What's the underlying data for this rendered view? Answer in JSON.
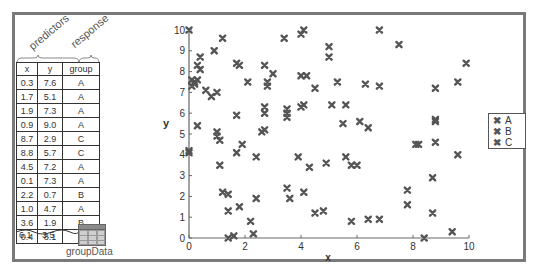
{
  "annotations": {
    "predictors_label": "predictors",
    "response_label": "response"
  },
  "table": {
    "name": "groupData",
    "headers": [
      "x",
      "y",
      "group"
    ],
    "rows": [
      [
        "0.3",
        "7.6",
        "A"
      ],
      [
        "1.7",
        "5.1",
        "A"
      ],
      [
        "1.9",
        "7.3",
        "A"
      ],
      [
        "0.9",
        "9.0",
        "A"
      ],
      [
        "8.7",
        "2.9",
        "C"
      ],
      [
        "8.8",
        "5.7",
        "C"
      ],
      [
        "4.5",
        "7.2",
        "A"
      ],
      [
        "0.1",
        "7.3",
        "A"
      ],
      [
        "2.2",
        "0.7",
        "B"
      ],
      [
        "1.0",
        "4.7",
        "A"
      ],
      [
        "3.6",
        "1.9",
        "B"
      ],
      [
        "0.4",
        "8.1",
        ""
      ]
    ],
    "cutoff_row": [
      "6.1",
      "3.5",
      ""
    ]
  },
  "colors": {
    "marker": "#555555",
    "frame": "#7a7a7a",
    "axis": "#666666"
  },
  "chart_data": {
    "type": "scatter",
    "title": "",
    "xlabel": "x",
    "ylabel": "y",
    "xlim": [
      0,
      10
    ],
    "ylim": [
      0,
      10
    ],
    "xticks": [
      "0",
      "2",
      "4",
      "6",
      "8",
      "10"
    ],
    "yticks": [
      "0",
      "1",
      "2",
      "3",
      "4",
      "5",
      "6",
      "7",
      "8",
      "9",
      "10"
    ],
    "grid": false,
    "legend_position": "right",
    "marker": "x",
    "series": [
      {
        "name": "A",
        "points": [
          [
            0.0,
            10.0
          ],
          [
            1.2,
            9.6
          ],
          [
            0.9,
            9.0
          ],
          [
            0.4,
            8.7
          ],
          [
            0.3,
            8.3
          ],
          [
            0.4,
            8.1
          ],
          [
            1.7,
            8.4
          ],
          [
            1.8,
            8.3
          ],
          [
            2.7,
            8.3
          ],
          [
            3.0,
            7.9
          ],
          [
            0.1,
            7.6
          ],
          [
            0.2,
            7.5
          ],
          [
            0.3,
            7.6
          ],
          [
            0.1,
            7.3
          ],
          [
            0.2,
            7.4
          ],
          [
            0.6,
            7.1
          ],
          [
            1.0,
            7.0
          ],
          [
            0.8,
            6.8
          ],
          [
            2.1,
            7.5
          ],
          [
            2.8,
            7.5
          ],
          [
            2.8,
            7.3
          ],
          [
            4.0,
            7.8
          ],
          [
            4.2,
            7.8
          ],
          [
            4.5,
            7.2
          ],
          [
            1.7,
            5.9
          ],
          [
            2.7,
            6.3
          ],
          [
            2.7,
            6.0
          ],
          [
            3.5,
            6.2
          ],
          [
            3.5,
            6.0
          ],
          [
            3.5,
            5.8
          ],
          [
            0.3,
            5.4
          ],
          [
            1.0,
            5.1
          ],
          [
            1.0,
            4.9
          ],
          [
            1.1,
            4.7
          ],
          [
            2.6,
            5.1
          ],
          [
            2.7,
            5.2
          ],
          [
            0.0,
            4.2
          ],
          [
            0.0,
            4.1
          ],
          [
            1.9,
            4.5
          ],
          [
            1.7,
            4.1
          ],
          [
            2.4,
            3.9
          ],
          [
            1.1,
            3.5
          ]
        ]
      },
      {
        "name": "B",
        "points": [
          [
            1.2,
            2.2
          ],
          [
            1.4,
            2.1
          ],
          [
            1.4,
            1.3
          ],
          [
            1.8,
            1.5
          ],
          [
            2.4,
            1.9
          ],
          [
            2.2,
            0.8
          ],
          [
            2.3,
            0.2
          ],
          [
            1.4,
            0.0
          ],
          [
            1.6,
            0.1
          ],
          [
            3.5,
            2.4
          ],
          [
            3.6,
            1.9
          ],
          [
            4.1,
            2.2
          ],
          [
            4.5,
            1.2
          ],
          [
            3.9,
            3.9
          ],
          [
            4.3,
            3.4
          ],
          [
            4.9,
            3.6
          ],
          [
            5.6,
            3.9
          ],
          [
            5.8,
            3.5
          ],
          [
            6.0,
            3.5
          ],
          [
            5.8,
            0.8
          ],
          [
            6.4,
            0.9
          ],
          [
            6.8,
            0.9
          ],
          [
            7.8,
            2.3
          ],
          [
            7.8,
            1.6
          ]
        ]
      },
      {
        "name": "C",
        "points": [
          [
            3.4,
            9.6
          ],
          [
            4.0,
            9.8
          ],
          [
            4.1,
            10.0
          ],
          [
            5.0,
            9.2
          ],
          [
            5.0,
            8.7
          ],
          [
            6.8,
            10.0
          ],
          [
            7.5,
            9.3
          ],
          [
            5.3,
            7.5
          ],
          [
            6.3,
            7.4
          ],
          [
            6.8,
            7.3
          ],
          [
            8.8,
            7.2
          ],
          [
            9.6,
            7.5
          ],
          [
            9.9,
            8.4
          ],
          [
            5.1,
            6.4
          ],
          [
            5.6,
            6.4
          ],
          [
            6.1,
            5.6
          ],
          [
            4.1,
            6.4
          ],
          [
            4.0,
            6.3
          ],
          [
            5.5,
            5.5
          ],
          [
            6.4,
            5.3
          ],
          [
            8.2,
            4.5
          ],
          [
            8.8,
            4.6
          ],
          [
            8.8,
            5.7
          ],
          [
            8.8,
            5.6
          ],
          [
            9.6,
            4.0
          ],
          [
            8.7,
            2.9
          ],
          [
            8.7,
            1.2
          ],
          [
            8.4,
            0.0
          ],
          [
            9.4,
            0.3
          ],
          [
            4.8,
            1.3
          ],
          [
            8.1,
            4.5
          ]
        ]
      }
    ]
  }
}
